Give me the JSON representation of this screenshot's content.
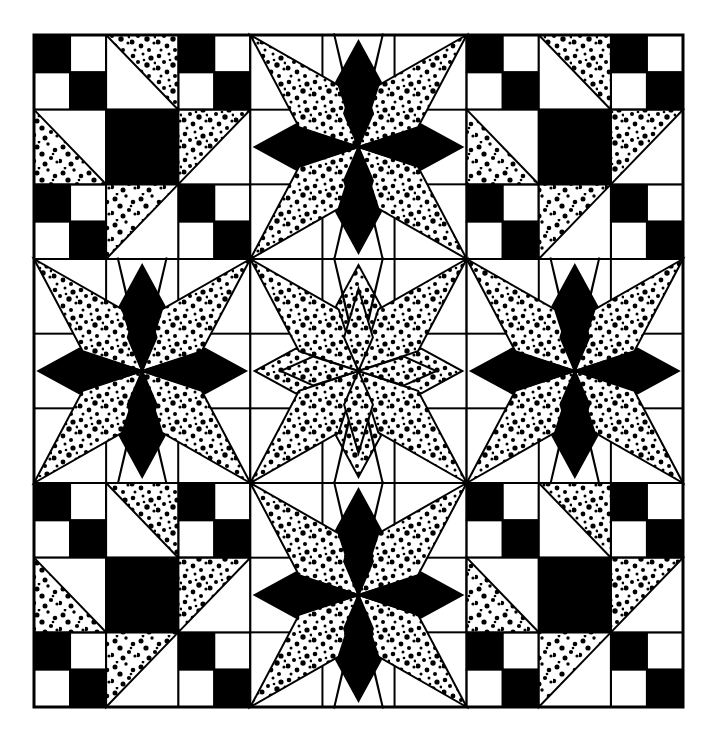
{
  "artwork": {
    "title": "Pieced quilt block pattern diagram",
    "kind": "line-art-quilt-diagram",
    "description": "Four-block-by-four-block patchwork quilt layout drawn in black ink on white: Shoofly blocks with four-patch corners and stippled half-square triangles alternate with eight-pointed LeMoyne stars.",
    "canvas": {
      "width": 707,
      "height": 734,
      "background": "#ffffff"
    },
    "palette": {
      "ink": "#000000",
      "paper": "#ffffff",
      "stipple_dot": "#000000",
      "outline": "#000000"
    },
    "frame": {
      "x": 34,
      "y": 35,
      "width": 649,
      "height": 672,
      "stroke_width": 3
    },
    "grid": {
      "columns": 8,
      "rows": 8,
      "cell_width": 81.125,
      "cell_height": 84.0,
      "line_width": 2
    },
    "fabrics": [
      {
        "id": "solid-dark",
        "label": "solid dark",
        "fill": "#000000"
      },
      {
        "id": "stipple",
        "label": "stippled print",
        "fill": "#ffffff",
        "dots": true
      },
      {
        "id": "plain",
        "label": "plain light",
        "fill": "#ffffff"
      }
    ],
    "blocks": [
      {
        "row": 0,
        "col": 0,
        "type": "shoofly",
        "name": "shoofly-top-left"
      },
      {
        "row": 0,
        "col": 1,
        "type": "star",
        "name": "star-top-center",
        "star_style": "cardinal-dark"
      },
      {
        "row": 0,
        "col": 2,
        "type": "shoofly",
        "name": "shoofly-top-right"
      },
      {
        "row": 1,
        "col": 0,
        "type": "star",
        "name": "star-middle-left",
        "star_style": "cardinal-dark"
      },
      {
        "row": 1,
        "col": 1,
        "type": "star",
        "name": "star-center",
        "star_style": "all-stipple"
      },
      {
        "row": 1,
        "col": 2,
        "type": "star",
        "name": "star-middle-right",
        "star_style": "cardinal-dark"
      },
      {
        "row": 2,
        "col": 0,
        "type": "shoofly",
        "name": "shoofly-bottom-left"
      },
      {
        "row": 2,
        "col": 1,
        "type": "star",
        "name": "star-bottom-center",
        "star_style": "cardinal-dark"
      },
      {
        "row": 2,
        "col": 2,
        "type": "shoofly",
        "name": "shoofly-bottom-right"
      }
    ],
    "shoofly_recipe": {
      "units": 3,
      "corners": "four-patch checkerboard, dark at top-left and bottom-right",
      "edges": "stippled half-square triangles",
      "center": "solid dark square"
    },
    "star_recipe": {
      "points": 8,
      "cardinal_points_fabric": "solid-dark",
      "diagonal_points_fabric": "stipple",
      "center_star_override": "all points stippled",
      "background": "plain"
    },
    "star_positions": [
      {
        "name": "star-top-center",
        "cx": 358,
        "cy": 161
      },
      {
        "name": "star-middle-left",
        "cx": 147,
        "cy": 371
      },
      {
        "name": "star-center",
        "cx": 358,
        "cy": 371
      },
      {
        "name": "star-middle-right",
        "cx": 569,
        "cy": 371
      },
      {
        "name": "star-bottom-center",
        "cx": 358,
        "cy": 581
      }
    ],
    "counts": {
      "blocks_total": 9,
      "stars_total": 5,
      "shoofly_total": 4,
      "four_patch_units": 16
    }
  }
}
